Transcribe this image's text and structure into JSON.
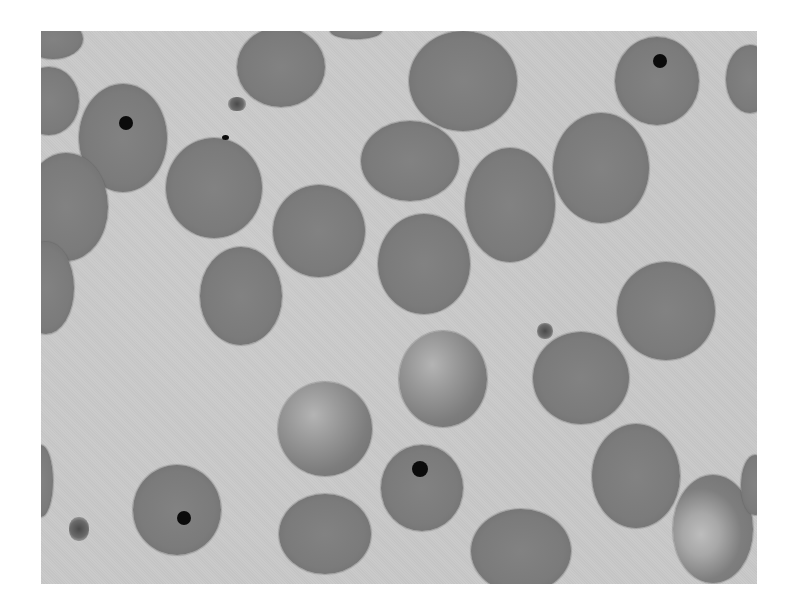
{
  "image": {
    "subject": "Blood smear micrograph: red blood cells, several containing Howell-Jolly bodies",
    "colors": {
      "page_background": "#ffffff",
      "plasma_background": "#c9c9c9",
      "cell_fill": "#7b7b7b",
      "inclusion": "#0b0b0b"
    },
    "frame": {
      "x": 41,
      "y": 31,
      "width": 716,
      "height": 553
    },
    "cells": [
      {
        "cx": 12,
        "cy": 8,
        "rx": 30,
        "ry": 20,
        "type": "normal"
      },
      {
        "cx": 8,
        "cy": 70,
        "rx": 30,
        "ry": 34,
        "type": "normal"
      },
      {
        "cx": 82,
        "cy": 107,
        "rx": 44,
        "ry": 54,
        "type": "normal",
        "inclusion": {
          "x": 85,
          "y": 92,
          "r": 7
        }
      },
      {
        "cx": 25,
        "cy": 176,
        "rx": 42,
        "ry": 54,
        "type": "normal"
      },
      {
        "cx": 5,
        "cy": 257,
        "rx": 28,
        "ry": 46,
        "type": "normal"
      },
      {
        "cx": 0,
        "cy": 450,
        "rx": 12,
        "ry": 36,
        "type": "normal"
      },
      {
        "cx": 240,
        "cy": 36,
        "rx": 44,
        "ry": 40,
        "type": "normal"
      },
      {
        "cx": 173,
        "cy": 157,
        "rx": 48,
        "ry": 50,
        "type": "normal"
      },
      {
        "cx": 278,
        "cy": 200,
        "rx": 46,
        "ry": 46,
        "type": "normal"
      },
      {
        "cx": 200,
        "cy": 265,
        "rx": 41,
        "ry": 49,
        "type": "normal"
      },
      {
        "cx": 315,
        "cy": 0,
        "rx": 26,
        "ry": 8,
        "type": "normal"
      },
      {
        "cx": 422,
        "cy": 50,
        "rx": 54,
        "ry": 50,
        "type": "normal"
      },
      {
        "cx": 369,
        "cy": 130,
        "rx": 49,
        "ry": 40,
        "type": "normal"
      },
      {
        "cx": 469,
        "cy": 174,
        "rx": 45,
        "ry": 57,
        "type": "normal"
      },
      {
        "cx": 383,
        "cy": 233,
        "rx": 46,
        "ry": 50,
        "type": "normal"
      },
      {
        "cx": 560,
        "cy": 137,
        "rx": 48,
        "ry": 55,
        "type": "normal"
      },
      {
        "cx": 616,
        "cy": 50,
        "rx": 42,
        "ry": 44,
        "type": "normal",
        "inclusion": {
          "x": 619,
          "y": 30,
          "r": 7
        }
      },
      {
        "cx": 709,
        "cy": 48,
        "rx": 24,
        "ry": 34,
        "type": "normal"
      },
      {
        "cx": 625,
        "cy": 280,
        "rx": 49,
        "ry": 49,
        "type": "normal"
      },
      {
        "cx": 402,
        "cy": 348,
        "rx": 44,
        "ry": 48,
        "type": "pale"
      },
      {
        "cx": 540,
        "cy": 347,
        "rx": 48,
        "ry": 46,
        "type": "normal"
      },
      {
        "cx": 284,
        "cy": 398,
        "rx": 47,
        "ry": 47,
        "type": "pale"
      },
      {
        "cx": 381,
        "cy": 457,
        "rx": 41,
        "ry": 43,
        "type": "normal",
        "inclusion": {
          "x": 379,
          "y": 438,
          "r": 8
        }
      },
      {
        "cx": 284,
        "cy": 503,
        "rx": 46,
        "ry": 40,
        "type": "normal"
      },
      {
        "cx": 480,
        "cy": 520,
        "rx": 50,
        "ry": 42,
        "type": "normal"
      },
      {
        "cx": 595,
        "cy": 445,
        "rx": 44,
        "ry": 52,
        "type": "normal"
      },
      {
        "cx": 672,
        "cy": 498,
        "rx": 40,
        "ry": 54,
        "type": "sickle"
      },
      {
        "cx": 714,
        "cy": 454,
        "rx": 14,
        "ry": 30,
        "type": "normal"
      },
      {
        "cx": 136,
        "cy": 479,
        "rx": 44,
        "ry": 45,
        "type": "normal",
        "inclusion": {
          "x": 143,
          "y": 487,
          "r": 7
        }
      }
    ],
    "platelets": [
      {
        "x": 187,
        "y": 66,
        "w": 18,
        "h": 14
      },
      {
        "x": 496,
        "y": 292,
        "w": 16,
        "h": 16
      },
      {
        "x": 28,
        "y": 486,
        "w": 20,
        "h": 24
      }
    ],
    "specks": [
      {
        "x": 181,
        "y": 104,
        "w": 7,
        "h": 5
      }
    ]
  }
}
